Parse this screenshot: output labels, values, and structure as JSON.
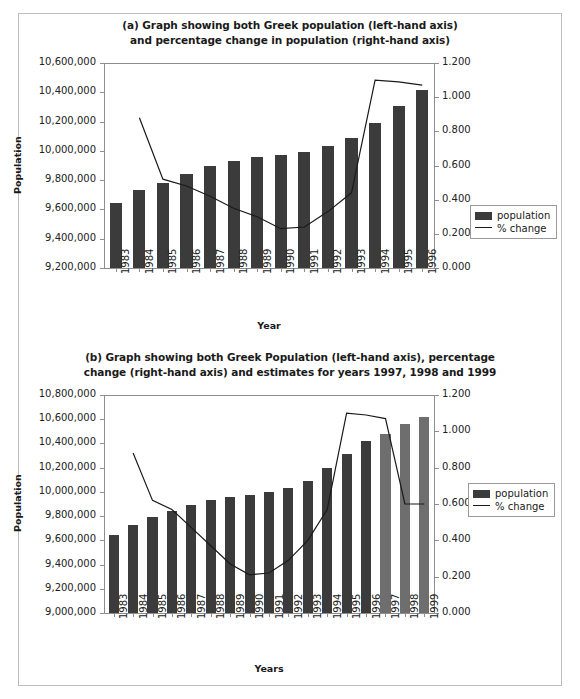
{
  "figure": {
    "border_color": "#bdbdbd",
    "bar_color_actual": "#3b3b3b",
    "bar_color_estimate": "#6e6e6e",
    "line_color": "#1a1a1a"
  },
  "legend": {
    "population_label": "population",
    "change_label": "% change"
  },
  "chart_data": [
    {
      "id": "chart-a",
      "type": "bar",
      "title": "(a) Graph showing both Greek population (left-hand axis) and percentage change in population (right-hand axis)",
      "title_line1": "(a) Graph showing both Greek population (left-hand axis)",
      "title_line2": "and percentage change in population (right-hand axis)",
      "xlabel": "Year",
      "ylabel": "Population",
      "y2label": "",
      "grid": false,
      "legend_position": "right-middle",
      "categories": [
        "1983",
        "1984",
        "1985",
        "1986",
        "1987",
        "1988",
        "1989",
        "1990",
        "1991",
        "1992",
        "1993",
        "1994",
        "1995",
        "1996"
      ],
      "ylim": [
        9200000,
        10600000
      ],
      "ytick_step": 200000,
      "yticks": [
        "9,200,000",
        "9,400,000",
        "9,600,000",
        "9,800,000",
        "10,000,000",
        "10,200,000",
        "10,400,000",
        "10,600,000"
      ],
      "ytick_values": [
        9200000,
        9400000,
        9600000,
        9800000,
        10000000,
        10200000,
        10400000,
        10600000
      ],
      "y2lim": [
        0.0,
        1.2
      ],
      "y2tick_step": 0.2,
      "y2ticks": [
        "0.000",
        "0.200",
        "0.400",
        "0.600",
        "0.800",
        "1.000",
        "1.200"
      ],
      "y2tick_values": [
        0.0,
        0.2,
        0.4,
        0.6,
        0.8,
        1.0,
        1.2
      ],
      "series": [
        {
          "name": "population",
          "kind": "bar",
          "axis": "left",
          "values": [
            9645000,
            9730000,
            9780000,
            9845000,
            9895000,
            9930000,
            9960000,
            9970000,
            9990000,
            10030000,
            10085000,
            10190000,
            10305000,
            10415000
          ]
        },
        {
          "name": "% change",
          "kind": "line",
          "axis": "right",
          "x": [
            "1984",
            "1985",
            "1986",
            "1987",
            "1988",
            "1989",
            "1990",
            "1991",
            "1992",
            "1993",
            "1994",
            "1995",
            "1996"
          ],
          "values": [
            0.88,
            0.52,
            0.48,
            0.42,
            0.35,
            0.3,
            0.23,
            0.24,
            0.33,
            0.44,
            1.1,
            1.09,
            1.07
          ]
        }
      ]
    },
    {
      "id": "chart-b",
      "type": "bar",
      "title": "(b) Graph showing both Greek Population (left-hand axis), percentage change (right-hand axis) and estimates for years 1997, 1998 and 1999",
      "title_line1": "(b) Graph showing both Greek Population (left-hand axis), percentage",
      "title_line2": "change (right-hand axis) and estimates for years 1997, 1998 and 1999",
      "xlabel": "Years",
      "ylabel": "Population",
      "y2label": "",
      "grid": false,
      "legend_position": "right-middle",
      "categories": [
        "1983",
        "1984",
        "1985",
        "1986",
        "1987",
        "1988",
        "1989",
        "1990",
        "1991",
        "1992",
        "1993",
        "1994",
        "1995",
        "1996",
        "1997",
        "1998",
        "1999"
      ],
      "estimate_categories": [
        "1997",
        "1998",
        "1999"
      ],
      "ylim": [
        9000000,
        10800000
      ],
      "ytick_step": 200000,
      "yticks": [
        "9,000,000",
        "9,200,000",
        "9,400,000",
        "9,600,000",
        "9,800,000",
        "10,000,000",
        "10,200,000",
        "10,400,000",
        "10,600,000",
        "10,800,000"
      ],
      "ytick_values": [
        9000000,
        9200000,
        9400000,
        9600000,
        9800000,
        10000000,
        10200000,
        10400000,
        10600000,
        10800000
      ],
      "y2lim": [
        0.0,
        1.2
      ],
      "y2tick_step": 0.2,
      "y2ticks": [
        "0.000",
        "0.200",
        "0.400",
        "0.600",
        "0.800",
        "1.000",
        "1.200"
      ],
      "y2tick_values": [
        0.0,
        0.2,
        0.4,
        0.6,
        0.8,
        1.0,
        1.2
      ],
      "series": [
        {
          "name": "population",
          "kind": "bar",
          "axis": "left",
          "values": [
            9645000,
            9730000,
            9790000,
            9845000,
            9895000,
            9930000,
            9960000,
            9975000,
            9995000,
            10035000,
            10090000,
            10195000,
            10310000,
            10420000,
            10480000,
            10560000,
            10620000
          ]
        },
        {
          "name": "% change",
          "kind": "line",
          "axis": "right",
          "x": [
            "1984",
            "1985",
            "1986",
            "1987",
            "1988",
            "1989",
            "1990",
            "1991",
            "1992",
            "1993",
            "1994",
            "1995",
            "1996",
            "1997",
            "1998",
            "1999"
          ],
          "values": [
            0.88,
            0.62,
            0.57,
            0.47,
            0.37,
            0.27,
            0.21,
            0.22,
            0.29,
            0.4,
            0.57,
            1.1,
            1.09,
            1.07,
            0.6,
            0.6,
            0.6
          ]
        }
      ]
    }
  ]
}
